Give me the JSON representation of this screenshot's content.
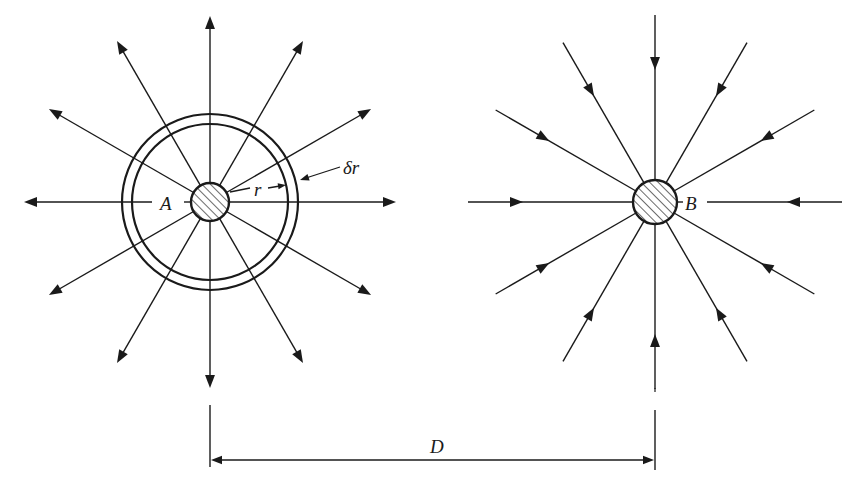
{
  "figure": {
    "ink_color": "#1a1a1a",
    "background": "#ffffff",
    "source": {
      "label": "A",
      "center": [
        210,
        202
      ],
      "radius": 19,
      "line_count": 12,
      "line_length": 186,
      "direction": "outward",
      "shell": {
        "inner_radius": 78,
        "outer_radius": 88
      },
      "annotations": {
        "radius_label": "r",
        "thickness_label": "δr"
      }
    },
    "sink": {
      "label": "B",
      "center": [
        655,
        202
      ],
      "radius": 22,
      "line_count": 12,
      "line_length": 187,
      "direction": "inward"
    },
    "dimension": {
      "label": "D",
      "from_x": 210,
      "to_x": 655,
      "y": 460
    }
  }
}
